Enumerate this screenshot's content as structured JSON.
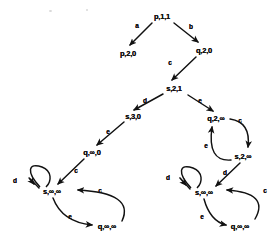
{
  "diagram": {
    "type": "state-transition-tree",
    "title": "",
    "ink_color": "#111111",
    "background_color": "#ffffff",
    "nodes": [
      {
        "id": "n0",
        "label": "p,1,1",
        "x": 162,
        "y": 16,
        "name": "node-p-1-1"
      },
      {
        "id": "n1",
        "label": "p,2,0",
        "x": 128,
        "y": 53,
        "name": "node-p-2-0"
      },
      {
        "id": "n2",
        "label": "q,2,0",
        "x": 204,
        "y": 50,
        "name": "node-q-2-0"
      },
      {
        "id": "n3",
        "label": "s,2,1",
        "x": 174,
        "y": 88,
        "name": "node-s-2-1"
      },
      {
        "id": "n4",
        "label": "s,3,0",
        "x": 133,
        "y": 116,
        "name": "node-s-3-0"
      },
      {
        "id": "n5",
        "label": "q,2,∞",
        "x": 216,
        "y": 118,
        "name": "node-q-2-inf"
      },
      {
        "id": "n6",
        "label": "q,∞,0",
        "x": 92,
        "y": 152,
        "name": "node-q-inf-0"
      },
      {
        "id": "n7",
        "label": "s,2,∞",
        "x": 243,
        "y": 156,
        "name": "node-s-2-inf"
      },
      {
        "id": "n8",
        "label": "s,∞,∞",
        "x": 52,
        "y": 191,
        "name": "node-s-inf-inf-left"
      },
      {
        "id": "n9",
        "label": "q,∞,∞",
        "x": 107,
        "y": 226,
        "name": "node-q-inf-inf-left"
      },
      {
        "id": "n10",
        "label": "s,∞,∞",
        "x": 204,
        "y": 192,
        "name": "node-s-inf-inf-right"
      },
      {
        "id": "n11",
        "label": "q,∞,∞",
        "x": 240,
        "y": 226,
        "name": "node-q-inf-inf-right"
      }
    ],
    "edges": [
      {
        "id": "e0",
        "label": "a",
        "from": "n0",
        "to": "n1",
        "lx": 137,
        "ly": 25,
        "name": "edge-a-p11-p20"
      },
      {
        "id": "e1",
        "label": "b",
        "from": "n0",
        "to": "n2",
        "lx": 191,
        "ly": 26,
        "name": "edge-b-p11-q20"
      },
      {
        "id": "e2",
        "label": "c",
        "from": "n2",
        "to": "n3",
        "lx": 170,
        "ly": 62,
        "name": "edge-c-q20-s21"
      },
      {
        "id": "e3",
        "label": "d",
        "from": "n3",
        "to": "n4",
        "lx": 145,
        "ly": 100,
        "name": "edge-d-s21-s30"
      },
      {
        "id": "e4",
        "label": "e",
        "from": "n3",
        "to": "n5",
        "lx": 200,
        "ly": 100,
        "name": "edge-e-s21-q2inf"
      },
      {
        "id": "e5",
        "label": "e",
        "from": "n4",
        "to": "n6",
        "lx": 108,
        "ly": 131,
        "name": "edge-e-s30-qinf0"
      },
      {
        "id": "e6",
        "label": "c",
        "from": "n5",
        "to": "n7",
        "lx": 240,
        "ly": 120,
        "name": "edge-c-q2inf-s2inf"
      },
      {
        "id": "e7",
        "label": "e",
        "from": "n7",
        "to": "n5",
        "lx": 206,
        "ly": 145,
        "name": "edge-e-s2inf-q2inf"
      },
      {
        "id": "e8",
        "label": "c",
        "from": "n6",
        "to": "n8",
        "lx": 76,
        "ly": 170,
        "name": "edge-c-qinf0-sinfinf"
      },
      {
        "id": "e9",
        "label": "d",
        "from": "n8",
        "to": "n8",
        "lx": 15,
        "ly": 180,
        "name": "edge-d-selfloop-left"
      },
      {
        "id": "e10",
        "label": "e",
        "from": "n8",
        "to": "n9",
        "lx": 70,
        "ly": 216,
        "name": "edge-e-sinfinf-qinfinf-left"
      },
      {
        "id": "e11",
        "label": "c",
        "from": "n9",
        "to": "n8",
        "lx": 100,
        "ly": 190,
        "name": "edge-c-qinfinf-sinfinf-left"
      },
      {
        "id": "e12",
        "label": "d",
        "from": "n7",
        "to": "n10",
        "lx": 225,
        "ly": 172,
        "name": "edge-d-s2inf-sinfinf"
      },
      {
        "id": "e13",
        "label": "d",
        "from": "n10",
        "to": "n10",
        "lx": 168,
        "ly": 177,
        "name": "edge-d-selfloop-right"
      },
      {
        "id": "e14",
        "label": "e",
        "from": "n10",
        "to": "n11",
        "lx": 202,
        "ly": 216,
        "name": "edge-e-sinfinf-qinfinf-right"
      },
      {
        "id": "e15",
        "label": "c",
        "from": "n11",
        "to": "n10",
        "lx": 265,
        "ly": 190,
        "name": "edge-c-qinfinf-sinfinf-right"
      }
    ]
  }
}
